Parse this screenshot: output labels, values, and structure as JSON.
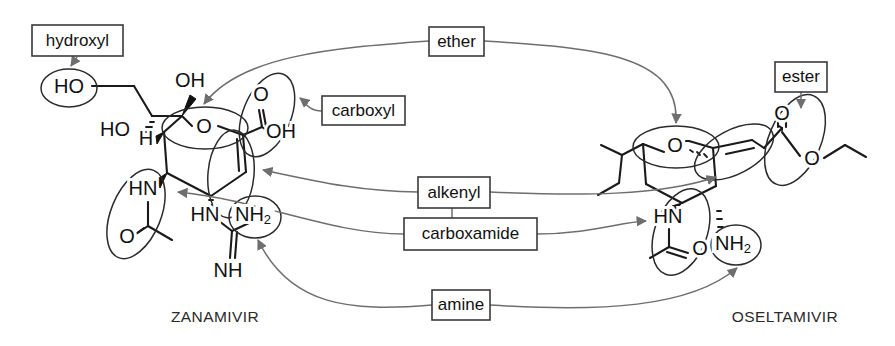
{
  "figure": {
    "type": "chemical-structure-comparison-diagram",
    "background": "#ffffff",
    "bond_color": "#1a1a1a",
    "connector_color": "#6e6e6e",
    "box_border_color": "#3a3a3a"
  },
  "molecules": [
    {
      "id": "zanamivir",
      "name": "ZANAMIVIR",
      "name_x": 215,
      "name_y": 318,
      "atom_labels": [
        {
          "text": "HO",
          "x": 69,
          "y": 88
        },
        {
          "text": "OH",
          "x": 190,
          "y": 82
        },
        {
          "text": "HO",
          "x": 115,
          "y": 131
        },
        {
          "text": "H",
          "x": 146,
          "y": 140
        },
        {
          "text": "O",
          "x": 204,
          "y": 128
        },
        {
          "text": "O",
          "x": 261,
          "y": 96
        },
        {
          "text": "OH",
          "x": 281,
          "y": 133
        },
        {
          "text": "HN",
          "x": 143,
          "y": 190
        },
        {
          "text": "O",
          "x": 127,
          "y": 238
        },
        {
          "text": "HN",
          "x": 205,
          "y": 216
        },
        {
          "text": "NH",
          "x": 253,
          "y": 216,
          "sub": "2"
        },
        {
          "text": "NH",
          "x": 228,
          "y": 272
        }
      ]
    },
    {
      "id": "oseltamivir",
      "name": "OSELTAMIVIR",
      "name_x": 785,
      "name_y": 318,
      "atom_labels": [
        {
          "text": "O",
          "x": 675,
          "y": 147
        },
        {
          "text": "O",
          "x": 782,
          "y": 115
        },
        {
          "text": "O",
          "x": 812,
          "y": 160
        },
        {
          "text": "HN",
          "x": 668,
          "y": 218
        },
        {
          "text": "O",
          "x": 700,
          "y": 250
        },
        {
          "text": "NH",
          "x": 733,
          "y": 245,
          "sub": "2"
        }
      ]
    }
  ],
  "functional_group_labels": [
    {
      "id": "hydroxyl",
      "text": "hydroxyl",
      "x": 32,
      "y": 25,
      "w": 91,
      "h": 31
    },
    {
      "id": "carboxyl",
      "text": "carboxyl",
      "x": 322,
      "y": 96,
      "w": 83,
      "h": 29
    },
    {
      "id": "ether",
      "text": "ether",
      "x": 429,
      "y": 27,
      "w": 55,
      "h": 29
    },
    {
      "id": "ester",
      "text": "ester",
      "x": 775,
      "y": 62,
      "w": 52,
      "h": 30
    },
    {
      "id": "alkenyl",
      "text": "alkenyl",
      "x": 418,
      "y": 177,
      "w": 72,
      "h": 31
    },
    {
      "id": "carboxamide",
      "text": "carboxamide",
      "x": 404,
      "y": 218,
      "w": 133,
      "h": 32
    },
    {
      "id": "amine",
      "text": "amine",
      "x": 432,
      "y": 290,
      "w": 58,
      "h": 30
    }
  ],
  "highlight_ellipses": [
    {
      "id": "zanamivir-hydroxyl-circle",
      "cx": 69,
      "cy": 88,
      "rx": 28,
      "ry": 19,
      "rot": 0
    },
    {
      "id": "zanamivir-carboxyl-ellipse",
      "cx": 267,
      "cy": 115,
      "rx": 24,
      "ry": 44,
      "rot": 22
    },
    {
      "id": "zanamivir-ether-ellipse",
      "cx": 205,
      "cy": 128,
      "rx": 43,
      "ry": 21,
      "rot": 0
    },
    {
      "id": "zanamivir-alkenyl-ellipse",
      "cx": 231,
      "cy": 174,
      "rx": 23,
      "ry": 44,
      "rot": 5
    },
    {
      "id": "zanamivir-carboxamide-ellipse",
      "cx": 136,
      "cy": 214,
      "rx": 25,
      "ry": 47,
      "rot": 22
    },
    {
      "id": "zanamivir-amine-circle",
      "cx": 255,
      "cy": 217,
      "rx": 26,
      "ry": 21,
      "rot": 0
    },
    {
      "id": "oseltamivir-ether-ellipse",
      "cx": 676,
      "cy": 147,
      "rx": 43,
      "ry": 21,
      "rot": 0
    },
    {
      "id": "oseltamivir-ester-ellipse",
      "cx": 795,
      "cy": 140,
      "rx": 26,
      "ry": 48,
      "rot": 23
    },
    {
      "id": "oseltamivir-alkenyl-ellipse",
      "cx": 734,
      "cy": 152,
      "rx": 22,
      "ry": 43,
      "rot": 62
    },
    {
      "id": "oseltamivir-carboxamide-ellipse",
      "cx": 681,
      "cy": 232,
      "rx": 26,
      "ry": 45,
      "rot": 20
    },
    {
      "id": "oseltamivir-amine-circle",
      "cx": 736,
      "cy": 245,
      "rx": 25,
      "ry": 20,
      "rot": 0
    }
  ]
}
